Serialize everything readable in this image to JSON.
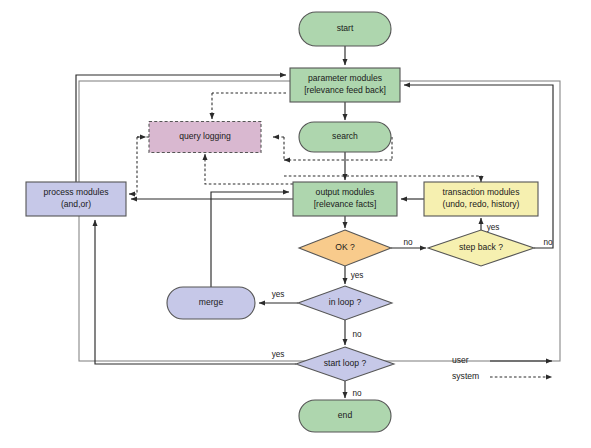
{
  "diagram": {
    "frame": {
      "x": 79,
      "y": 81,
      "w": 481,
      "h": 280
    },
    "colors": {
      "green_fill": "#aed6ae",
      "green_stroke": "#5c8a5c",
      "purple_fill": "#c6c8e8",
      "purple_stroke": "#6b6f99",
      "pink_fill": "#d9b8d0",
      "pink_stroke": "#8c6a86",
      "yellow_fill": "#f6f0b0",
      "yellow_stroke": "#9a9450",
      "orange_fill": "#f8cb8c",
      "orange_stroke": "#b08a4d",
      "edge": "#2b2b2b",
      "frame": "#888888"
    },
    "nodes": [
      {
        "id": "start",
        "label": "start",
        "shape": "stadium",
        "fill": "green",
        "x": 345,
        "y": 29,
        "w": 92,
        "h": 34
      },
      {
        "id": "parameter",
        "label": "parameter modules",
        "label2": "[relevance feed back]",
        "shape": "rect",
        "fill": "green",
        "x": 345,
        "y": 85,
        "w": 110,
        "h": 34
      },
      {
        "id": "search",
        "label": "search",
        "shape": "stadium",
        "fill": "green",
        "x": 345,
        "y": 137,
        "w": 92,
        "h": 30
      },
      {
        "id": "query",
        "label": "query logging",
        "shape": "rect-dashed",
        "fill": "pink",
        "x": 205,
        "y": 137,
        "w": 112,
        "h": 31
      },
      {
        "id": "process",
        "label": "process modules",
        "label2": "(and,or)",
        "shape": "rect",
        "fill": "purple",
        "x": 76,
        "y": 199,
        "w": 100,
        "h": 34
      },
      {
        "id": "output",
        "label": "output modules",
        "label2": "[relevance facts]",
        "shape": "rect",
        "fill": "green",
        "x": 345,
        "y": 199,
        "w": 104,
        "h": 34
      },
      {
        "id": "transaction",
        "label": "transaction modules",
        "label2": "(undo, redo, history)",
        "shape": "rect",
        "fill": "yellow",
        "x": 481,
        "y": 199,
        "w": 114,
        "h": 34
      },
      {
        "id": "ok",
        "label": "OK ?",
        "shape": "diamond",
        "fill": "orange",
        "x": 345,
        "y": 248,
        "w": 92,
        "h": 36
      },
      {
        "id": "stepback",
        "label": "step back ?",
        "shape": "diamond",
        "fill": "yellow",
        "x": 481,
        "y": 248,
        "w": 106,
        "h": 36
      },
      {
        "id": "merge",
        "label": "merge",
        "shape": "stadium",
        "fill": "purple",
        "x": 211,
        "y": 303,
        "w": 88,
        "h": 32
      },
      {
        "id": "inloop",
        "label": "in loop ?",
        "shape": "diamond",
        "fill": "purple",
        "x": 345,
        "y": 303,
        "w": 94,
        "h": 34
      },
      {
        "id": "startloop",
        "label": "start loop ?",
        "shape": "diamond",
        "fill": "purple",
        "x": 345,
        "y": 364,
        "w": 98,
        "h": 34
      },
      {
        "id": "end",
        "label": "end",
        "shape": "stadium",
        "fill": "green",
        "x": 345,
        "y": 416,
        "w": 92,
        "h": 32
      }
    ],
    "edge_labels": [
      {
        "text": "no",
        "x": 408,
        "y": 243
      },
      {
        "text": "no",
        "x": 548,
        "y": 243
      },
      {
        "text": "yes",
        "x": 493,
        "y": 228
      },
      {
        "text": "yes",
        "x": 357,
        "y": 276
      },
      {
        "text": "yes",
        "x": 278,
        "y": 295
      },
      {
        "text": "no",
        "x": 357,
        "y": 335
      },
      {
        "text": "yes",
        "x": 278,
        "y": 355
      },
      {
        "text": "no",
        "x": 357,
        "y": 394
      }
    ],
    "legend": {
      "items": [
        {
          "label": "user",
          "style": "solid",
          "x": 452,
          "y": 361
        },
        {
          "label": "system",
          "style": "dashed",
          "x": 452,
          "y": 377
        }
      ]
    }
  }
}
